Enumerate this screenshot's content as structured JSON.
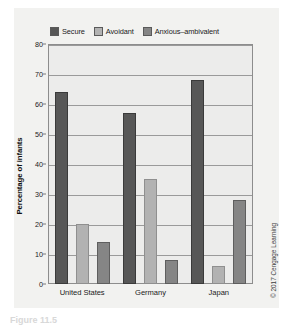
{
  "chart_data": {
    "type": "bar",
    "title": "",
    "xlabel": "",
    "ylabel": "Percentage of infants",
    "ylim": [
      0,
      80
    ],
    "ytick_step": 10,
    "yticks": [
      0,
      10,
      20,
      30,
      40,
      50,
      60,
      70,
      80
    ],
    "grid": true,
    "legend_position": "top",
    "categories": [
      "United States",
      "Germany",
      "Japan"
    ],
    "series": [
      {
        "name": "Secure",
        "values": [
          64,
          57,
          68
        ],
        "color": "#575757"
      },
      {
        "name": "Avoidant",
        "values": [
          20,
          35,
          6
        ],
        "color": "#b2b2b2"
      },
      {
        "name": "Anxious-ambivalent",
        "values": [
          14,
          8,
          28
        ],
        "color": "#858585"
      }
    ]
  },
  "legend": {
    "items": [
      {
        "label": "Secure"
      },
      {
        "label": "Avoidant"
      },
      {
        "label": "Anxious–ambivalent"
      }
    ]
  },
  "axis": {
    "y_title": "Percentage of infants"
  },
  "credit": {
    "text": "© 2017 Cengage Learning"
  },
  "caption": {
    "text": "Figure 11.5"
  }
}
